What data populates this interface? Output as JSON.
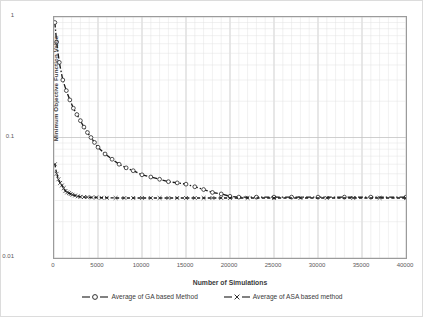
{
  "chart_data": {
    "type": "line",
    "title": "",
    "subtitle": "",
    "xlabel": "Number of Simulations",
    "ylabel": "Minimum Objective Function Value",
    "xlim": [
      0,
      40000
    ],
    "ylim": [
      0.01,
      1
    ],
    "yscale": "log",
    "xscale": "linear",
    "grid": true,
    "grid_minor": true,
    "legend_position": "bottom",
    "xticks": [
      0,
      5000,
      10000,
      15000,
      20000,
      25000,
      30000,
      35000,
      40000
    ],
    "xticklabels": [
      "0",
      "5000",
      "10000",
      "15000",
      "20000",
      "25000",
      "30000",
      "35000",
      "40000"
    ],
    "yticks": [
      0.01,
      0.1,
      1
    ],
    "yticklabels": [
      "0.01",
      "0.1",
      "1"
    ],
    "series": [
      {
        "name": "Average of GA based Method",
        "marker": "circle-open",
        "linestyle": "dash-dot",
        "color": "#1a1a1a",
        "x": [
          100,
          300,
          600,
          1000,
          1400,
          1800,
          2200,
          2600,
          3000,
          3400,
          3800,
          4200,
          4600,
          5000,
          5800,
          6600,
          7400,
          8200,
          9000,
          10000,
          11000,
          12000,
          13000,
          14000,
          15000,
          16000,
          17000,
          18000,
          19000,
          20000,
          21000,
          23000,
          25000,
          27000,
          30000,
          33000,
          36000,
          40000
        ],
        "y": [
          0.9,
          0.62,
          0.42,
          0.3,
          0.245,
          0.205,
          0.175,
          0.155,
          0.138,
          0.122,
          0.11,
          0.1,
          0.091,
          0.083,
          0.073,
          0.066,
          0.06,
          0.056,
          0.053,
          0.049,
          0.047,
          0.045,
          0.043,
          0.042,
          0.041,
          0.039,
          0.037,
          0.035,
          0.034,
          0.0325,
          0.032,
          0.032,
          0.032,
          0.032,
          0.032,
          0.032,
          0.032,
          0.032
        ]
      },
      {
        "name": "Average of ASA based method",
        "marker": "x-cross",
        "linestyle": "dash",
        "color": "#1a1a1a",
        "x": [
          100,
          300,
          500,
          700,
          900,
          1100,
          1300,
          1500,
          1700,
          1900,
          2100,
          2400,
          2700,
          3000,
          3400,
          3800,
          4300,
          4800,
          5400,
          6000,
          7000,
          8000,
          9000,
          10000,
          11000,
          12000,
          13000,
          14000,
          15000,
          16000,
          17000,
          18000,
          19000,
          20000,
          22000,
          25000,
          28000,
          31000,
          34000,
          37000,
          40000
        ],
        "y": [
          0.06,
          0.05,
          0.045,
          0.042,
          0.04,
          0.038,
          0.036,
          0.035,
          0.0345,
          0.034,
          0.0335,
          0.033,
          0.0325,
          0.0322,
          0.032,
          0.032,
          0.0318,
          0.0318,
          0.0316,
          0.0316,
          0.0315,
          0.0315,
          0.0315,
          0.0315,
          0.0315,
          0.0315,
          0.0315,
          0.0315,
          0.0315,
          0.0315,
          0.0315,
          0.0315,
          0.0315,
          0.0315,
          0.0315,
          0.0315,
          0.0315,
          0.0315,
          0.0315,
          0.0315,
          0.0315
        ]
      }
    ]
  },
  "legend": {
    "entries": [
      {
        "label": "Average of GA based Method"
      },
      {
        "label": "Average of ASA based method"
      }
    ]
  },
  "colors": {
    "series_ink": "#1a1a1a",
    "grid_major": "#c3c3c3",
    "grid_minor": "#e2e2e2",
    "axis_frame": "#9b9b9b",
    "tick_text": "#5a5a5a",
    "outer_border": "#dcdcdc"
  }
}
